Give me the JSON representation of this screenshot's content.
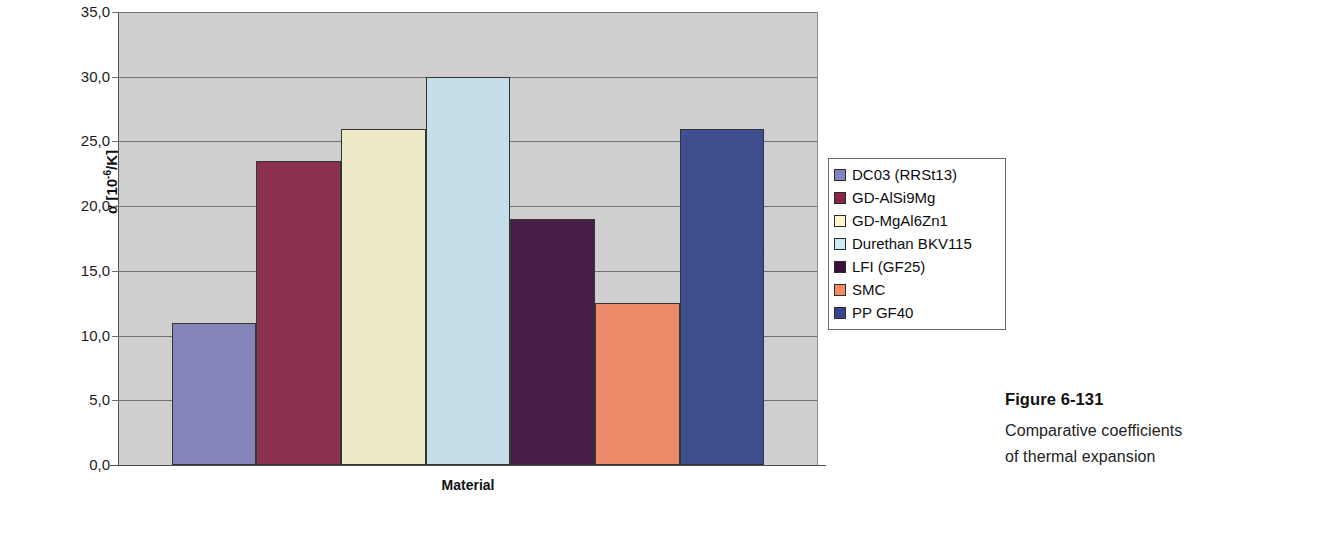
{
  "chart_data": {
    "type": "bar",
    "title": "",
    "xlabel": "Material",
    "ylabel": "α [10⁻⁶/K]",
    "ylim": [
      0,
      35
    ],
    "ytick_values": [
      0,
      5,
      10,
      15,
      20,
      25,
      30,
      35
    ],
    "ytick_labels": [
      "0,0",
      "5,0",
      "10,0",
      "15,0",
      "20,0",
      "25,0",
      "30,0",
      "35,0"
    ],
    "grid": true,
    "legend_position": "right",
    "categories": [
      "DC03 (RRSt13)",
      "GD-AlSi9Mg",
      "GD-MgAl6Zn1",
      "Durethan BKV115",
      "LFI (GF25)",
      "SMC",
      "PP GF40"
    ],
    "values": [
      11.0,
      23.5,
      26.0,
      30.0,
      19.0,
      12.5,
      26.0
    ],
    "colors": [
      "#8284bf",
      "#8a2449",
      "#fcf7cd",
      "#cdeaf7",
      "#3d0f3f",
      "#f88a63",
      "#34468f"
    ],
    "plot_background": "#d4d4d4",
    "bar_border_color": "#2b2b2b"
  },
  "axis": {
    "y_title_main": "α [10",
    "y_title_exp": "-6",
    "y_title_tail": "/K]",
    "x_title": "Material"
  },
  "legend": {
    "items": [
      {
        "label": "DC03 (RRSt13)",
        "color": "#8284bf"
      },
      {
        "label": "GD-AlSi9Mg",
        "color": "#8a2449"
      },
      {
        "label": "GD-MgAl6Zn1",
        "color": "#fcf7cd"
      },
      {
        "label": "Durethan BKV115",
        "color": "#cdeaf7"
      },
      {
        "label": "LFI (GF25)",
        "color": "#3d0f3f"
      },
      {
        "label": "SMC",
        "color": "#f88a63"
      },
      {
        "label": "PP GF40",
        "color": "#34468f"
      }
    ]
  },
  "caption": {
    "title": "Figure 6-131",
    "line1": "Comparative coefficients",
    "line2": "of thermal expansion"
  }
}
